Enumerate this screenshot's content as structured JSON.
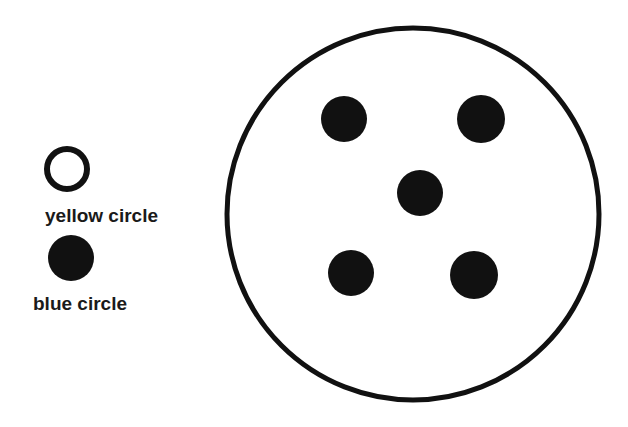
{
  "legend": {
    "items": [
      {
        "label": "yellow circle",
        "style": "hollow",
        "cx": 67,
        "cy": 169,
        "r": 20,
        "stroke_width": 6,
        "label_x": 45,
        "label_y": 222
      },
      {
        "label": "blue circle",
        "style": "filled",
        "cx": 71,
        "cy": 258,
        "r": 23,
        "label_x": 33,
        "label_y": 310
      }
    ]
  },
  "container": {
    "shape": "circle",
    "cx": 413,
    "cy": 214,
    "r": 186,
    "stroke_width": 5
  },
  "dots": [
    {
      "cx": 344,
      "cy": 119,
      "r": 23
    },
    {
      "cx": 481,
      "cy": 119,
      "r": 24
    },
    {
      "cx": 420,
      "cy": 193,
      "r": 23
    },
    {
      "cx": 351,
      "cy": 273,
      "r": 23
    },
    {
      "cx": 474,
      "cy": 275,
      "r": 24
    }
  ],
  "colors": {
    "ink": "#111111",
    "background": "#ffffff"
  }
}
